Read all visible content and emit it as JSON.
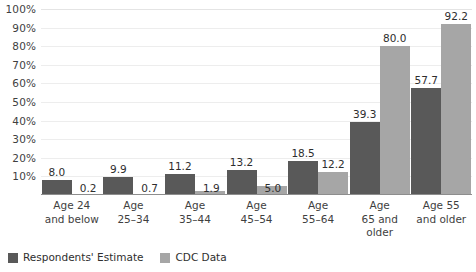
{
  "chart_data": {
    "type": "bar",
    "title": "",
    "subtitle": "",
    "xlabel": "",
    "ylabel": "",
    "ylim": [
      0,
      100
    ],
    "ytick_step": 10,
    "ytick_labels": [
      "100%",
      "90%",
      "80%",
      "70%",
      "60%",
      "50%",
      "40%",
      "30%",
      "20%",
      "10%"
    ],
    "ytick_values": [
      100,
      90,
      80,
      70,
      60,
      50,
      40,
      30,
      20,
      10
    ],
    "grid": true,
    "legend_position": "bottom-left",
    "categories": [
      "Age 24\nand below",
      "Age\n25–34",
      "Age\n35–44",
      "Age\n45–54",
      "Age\n55–64",
      "Age\n65 and\nolder",
      "Age 55\nand older"
    ],
    "series": [
      {
        "name": "Respondents' Estimate",
        "color": "#595959",
        "values": [
          8.0,
          9.9,
          11.2,
          13.2,
          18.5,
          39.3,
          57.7
        ],
        "labels": [
          "8.0",
          "9.9",
          "11.2",
          "13.2",
          "18.5",
          "39.3",
          "57.7"
        ]
      },
      {
        "name": "CDC Data",
        "color": "#a6a6a6",
        "values": [
          0.2,
          0.7,
          1.9,
          5.0,
          12.2,
          80.0,
          92.2
        ],
        "labels": [
          "0.2",
          "0.7",
          "1.9",
          "5.0",
          "12.2",
          "80.0",
          "92.2"
        ]
      }
    ]
  },
  "colors": {
    "series_estimate": "#595959",
    "series_cdc": "#a6a6a6",
    "gridline": "#ededed",
    "axis": "#8d8d8d",
    "background": "#ffffff",
    "text": "#3a3a3a"
  }
}
